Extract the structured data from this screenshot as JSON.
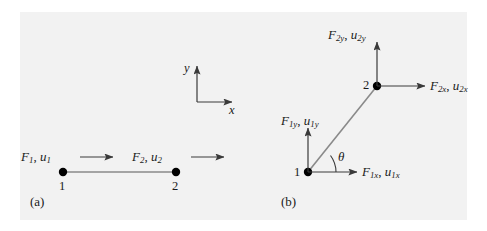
{
  "figure": {
    "background_color": "#f2f2f2",
    "page_color": "#ffffff",
    "line_color": "#6e6e6e",
    "node_color": "#000000",
    "text_color": "#1a1a1a"
  },
  "global_axes": {
    "y_label": "y",
    "x_label": "x"
  },
  "panel_a": {
    "caption": "(a)",
    "node1_number": "1",
    "node2_number": "2",
    "force1": {
      "force": "F",
      "force_sub": "1",
      "disp": "u",
      "disp_sub": "1",
      "separator": ", "
    },
    "force2": {
      "force": "F",
      "force_sub": "2",
      "disp": "u",
      "disp_sub": "2",
      "separator": ", "
    },
    "arrow1_name": "force-arrow-node1",
    "arrow2_name": "force-arrow-node2",
    "element_name": "bar-element-local"
  },
  "panel_b": {
    "caption": "(b)",
    "node1_number": "1",
    "node2_number": "2",
    "angle_symbol": "θ",
    "force1x": {
      "force": "F",
      "force_sub": "1x",
      "disp": "u",
      "disp_sub": "1x",
      "separator": ", "
    },
    "force1y": {
      "force": "F",
      "force_sub": "1y",
      "disp": "u",
      "disp_sub": "1y",
      "separator": ", "
    },
    "force2x": {
      "force": "F",
      "force_sub": "2x",
      "disp": "u",
      "disp_sub": "2x",
      "separator": ", "
    },
    "force2y": {
      "force": "F",
      "force_sub": "2y",
      "disp": "u",
      "disp_sub": "2y",
      "separator": ", "
    },
    "element_name": "bar-element-global"
  }
}
